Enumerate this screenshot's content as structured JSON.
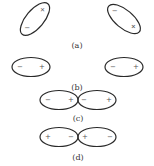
{
  "figure": {
    "panels": [
      {
        "id": "a",
        "caption": "(a)",
        "description": "Two tilted dipoles in random orientations",
        "dipoles": [
          {
            "pos_sign": "+",
            "neg_sign": "−"
          },
          {
            "pos_sign": "+",
            "neg_sign": "−"
          }
        ]
      },
      {
        "id": "b",
        "caption": "(b)",
        "description": "Two separated aligned dipoles",
        "dipoles": [
          {
            "left_sign": "−",
            "right_sign": "+"
          },
          {
            "left_sign": "−",
            "right_sign": "+"
          }
        ]
      },
      {
        "id": "c",
        "caption": "(c)",
        "description": "Two touching dipoles, head-to-tail",
        "dipoles": [
          {
            "left_sign": "−",
            "right_sign": "+"
          },
          {
            "left_sign": "−",
            "right_sign": "+"
          }
        ]
      },
      {
        "id": "d",
        "caption": "(d)",
        "description": "Two touching dipoles, like charges adjacent",
        "dipoles": [
          {
            "left_sign": "+",
            "right_sign": "−"
          },
          {
            "left_sign": "+",
            "right_sign": "−"
          }
        ]
      }
    ],
    "colors": {
      "outline": "#2a2a2a",
      "sign": "#555555",
      "caption": "#333333",
      "background": "#ffffff"
    }
  }
}
